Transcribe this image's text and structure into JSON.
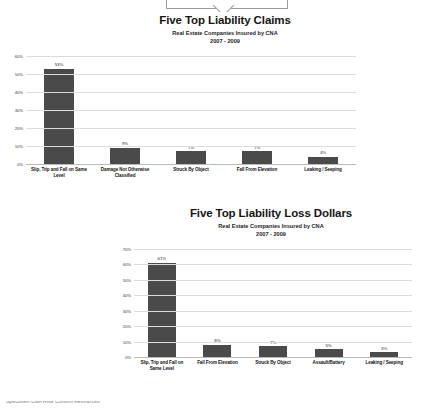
{
  "page": {
    "ribbon_label": "",
    "footer_cut_text": "Specimen CNA Risk Control Resources"
  },
  "chart_data": [
    {
      "id": "claims",
      "type": "bar",
      "title": "Five Top Liability Claims",
      "subtitle1": "Real Estate Companies Insured by CNA",
      "subtitle2": "2007 - 2009",
      "xlabel": "",
      "ylabel": "",
      "ylim": [
        0,
        60
      ],
      "grid": true,
      "legend": "none",
      "bar_color": "#4a4a4a",
      "yticks": [
        "0%",
        "10%",
        "20%",
        "30%",
        "40%",
        "50%",
        "60%"
      ],
      "ytick_values": [
        0,
        10,
        20,
        30,
        40,
        50,
        60
      ],
      "categories": [
        "Slip, Trip and Fall on Same Level",
        "Damage Not Otherwise Classified",
        "Struck By Object",
        "Fall From Elevation",
        "Leaking / Seeping"
      ],
      "values": [
        53,
        9,
        7,
        7,
        4
      ],
      "data_labels": [
        "53%",
        "9%",
        "7%",
        "7%",
        "4%"
      ]
    },
    {
      "id": "loss",
      "type": "bar",
      "title": "Five Top Liability Loss Dollars",
      "subtitle1": "Real Estate Companies Insured by CNA",
      "subtitle2": "2007 - 2009",
      "xlabel": "",
      "ylabel": "",
      "ylim": [
        0,
        70
      ],
      "grid": true,
      "legend": "none",
      "bar_color": "#4a4a4a",
      "yticks": [
        "0%",
        "10%",
        "20%",
        "30%",
        "40%",
        "50%",
        "60%",
        "70%"
      ],
      "ytick_values": [
        0,
        10,
        20,
        30,
        40,
        50,
        60,
        70
      ],
      "categories": [
        "Slip, Trip and Fall on Same Level",
        "Fall From Elevation",
        "Struck By Object",
        "Assault/Battery",
        "Leaking / Seeping"
      ],
      "values": [
        61,
        8,
        7,
        5,
        3
      ],
      "data_labels": [
        "61%",
        "8%",
        "7%",
        "5%",
        "3%"
      ]
    }
  ]
}
